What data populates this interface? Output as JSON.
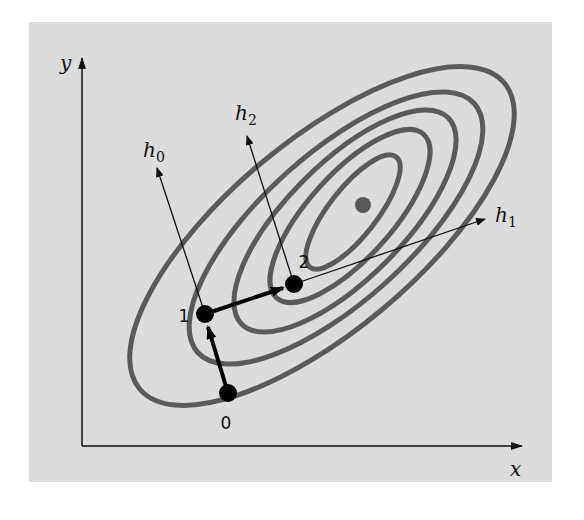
{
  "figure": {
    "background_color": "#dcdcdc",
    "contour_color": "#5a5a5a",
    "axis_color": "#111111",
    "path_color": "#000000",
    "optimum_color": "#5a5a5a"
  },
  "axes": {
    "x_label": "x",
    "y_label": "y"
  },
  "points": [
    {
      "label": "0",
      "x": 228,
      "y": 393
    },
    {
      "label": "1",
      "x": 205,
      "y": 314
    },
    {
      "label": "2",
      "x": 294,
      "y": 284
    }
  ],
  "optimum": {
    "x": 363,
    "y": 205
  },
  "directions": [
    {
      "name": "h",
      "sub": "0",
      "from_point": "1"
    },
    {
      "name": "h",
      "sub": "1",
      "from_point": "2"
    },
    {
      "name": "h",
      "sub": "2",
      "from_point": "2"
    }
  ],
  "contours": {
    "count": 5
  }
}
